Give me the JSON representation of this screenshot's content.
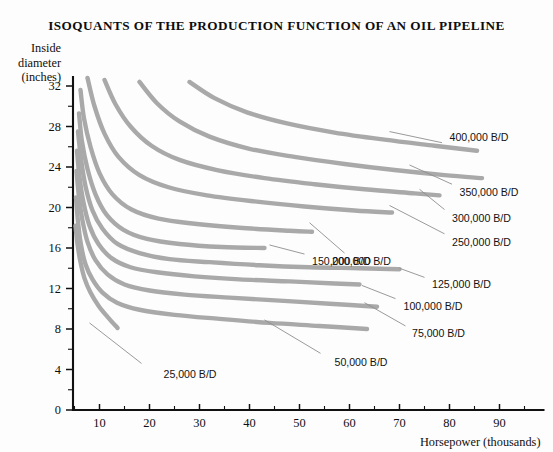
{
  "chart_data": {
    "type": "line",
    "title": "ISOQUANTS OF THE PRODUCTION FUNCTION OF AN OIL PIPELINE",
    "xlabel": "Horsepower (thousands)",
    "ylabel_lines": [
      "Inside",
      "diameter",
      "(inches)"
    ],
    "xlim": [
      4.7,
      99
    ],
    "ylim": [
      0,
      33
    ],
    "xticks": [
      10,
      20,
      30,
      40,
      50,
      60,
      70,
      80,
      90
    ],
    "xticks_minor": [
      5,
      15,
      25,
      35,
      45,
      55,
      65,
      75,
      85,
      95
    ],
    "yticks": [
      0,
      4,
      8,
      12,
      16,
      20,
      24,
      28,
      32
    ],
    "yticks_minor": [
      2,
      6,
      10,
      14,
      18,
      22,
      26,
      30
    ],
    "grid": false,
    "legend_position": "inline-labels-right",
    "curve_color": "#a9a9a9",
    "axis_color": "#111111",
    "series": [
      {
        "name": "25,000 B/D",
        "label": "25,000 B/D",
        "label_x": 22.8,
        "label_y": 3.6,
        "leader": [
          [
            18.4,
            4.6
          ],
          [
            8.0,
            8.6
          ]
        ],
        "points": [
          [
            5.2,
            18.2
          ],
          [
            5.6,
            16.4
          ],
          [
            6.2,
            14.6
          ],
          [
            7.0,
            13.0
          ],
          [
            8.2,
            11.6
          ],
          [
            9.8,
            10.3
          ],
          [
            11.6,
            9.2
          ],
          [
            13.6,
            8.1
          ]
        ]
      },
      {
        "name": "50,000 B/D",
        "label": "50,000 B/D",
        "label_x": 57.0,
        "label_y": 4.7,
        "leader": [
          [
            54.2,
            5.6
          ],
          [
            43.0,
            8.9
          ]
        ],
        "points": [
          [
            5.3,
            21.0
          ],
          [
            5.7,
            18.6
          ],
          [
            6.3,
            16.3
          ],
          [
            7.2,
            14.4
          ],
          [
            8.6,
            12.9
          ],
          [
            10.6,
            11.6
          ],
          [
            13.5,
            10.6
          ],
          [
            18.0,
            9.9
          ],
          [
            25.0,
            9.4
          ],
          [
            34.0,
            9.0
          ],
          [
            44.0,
            8.6
          ],
          [
            54.0,
            8.3
          ],
          [
            63.5,
            8.0
          ]
        ]
      },
      {
        "name": "75,000 B/D",
        "label": "75,000 B/D",
        "label_x": 72.5,
        "label_y": 7.6,
        "leader": [
          [
            71.2,
            8.3
          ],
          [
            63.0,
            10.6
          ]
        ],
        "points": [
          [
            5.4,
            23.6
          ],
          [
            5.9,
            21.0
          ],
          [
            6.6,
            18.7
          ],
          [
            7.6,
            16.6
          ],
          [
            9.2,
            14.8
          ],
          [
            11.6,
            13.4
          ],
          [
            15.0,
            12.4
          ],
          [
            20.0,
            11.8
          ],
          [
            27.0,
            11.4
          ],
          [
            36.0,
            11.1
          ],
          [
            46.0,
            10.8
          ],
          [
            56.0,
            10.5
          ],
          [
            65.5,
            10.2
          ]
        ]
      },
      {
        "name": "100,000 B/D",
        "label": "100,000 B/D",
        "label_x": 70.8,
        "label_y": 10.3,
        "leader": [
          [
            69.2,
            11.0
          ],
          [
            62.5,
            12.3
          ]
        ],
        "points": [
          [
            5.5,
            25.6
          ],
          [
            6.0,
            23.0
          ],
          [
            6.8,
            20.5
          ],
          [
            8.0,
            18.2
          ],
          [
            9.8,
            16.4
          ],
          [
            12.4,
            15.0
          ],
          [
            16.2,
            14.1
          ],
          [
            21.5,
            13.6
          ],
          [
            29.0,
            13.2
          ],
          [
            38.0,
            12.9
          ],
          [
            48.0,
            12.7
          ],
          [
            57.0,
            12.5
          ],
          [
            62.0,
            12.4
          ]
        ]
      },
      {
        "name": "125,000 B/D",
        "label": "125,000 B/D",
        "label_x": 76.5,
        "label_y": 12.4,
        "leader": [
          [
            75.0,
            13.1
          ],
          [
            70.0,
            14.0
          ]
        ],
        "points": [
          [
            5.7,
            27.5
          ],
          [
            6.3,
            24.8
          ],
          [
            7.2,
            22.1
          ],
          [
            8.6,
            19.7
          ],
          [
            10.6,
            17.9
          ],
          [
            13.6,
            16.4
          ],
          [
            18.0,
            15.5
          ],
          [
            24.0,
            14.9
          ],
          [
            32.0,
            14.6
          ],
          [
            42.0,
            14.3
          ],
          [
            52.0,
            14.1
          ],
          [
            62.0,
            14.0
          ],
          [
            70.0,
            13.9
          ]
        ]
      },
      {
        "name": "150,000 B/D",
        "label": "150,000 B/D",
        "label_x": 52.5,
        "label_y": 14.7,
        "leader": [
          [
            51.0,
            15.4
          ],
          [
            44.0,
            16.3
          ]
        ],
        "points": [
          [
            5.9,
            29.3
          ],
          [
            6.5,
            26.5
          ],
          [
            7.6,
            23.8
          ],
          [
            9.2,
            21.3
          ],
          [
            11.4,
            19.3
          ],
          [
            14.8,
            17.8
          ],
          [
            19.5,
            16.9
          ],
          [
            26.0,
            16.4
          ],
          [
            34.5,
            16.1
          ],
          [
            43.0,
            16.0
          ]
        ]
      },
      {
        "name": "200,000 B/D",
        "label": "200,000 B/D",
        "label_x": 56.5,
        "label_y": 14.7,
        "leader": [
          [
            59.0,
            15.5
          ],
          [
            52.0,
            18.5
          ]
        ],
        "points": [
          [
            6.2,
            31.6
          ],
          [
            6.9,
            28.8
          ],
          [
            8.2,
            26.0
          ],
          [
            10.0,
            23.4
          ],
          [
            12.6,
            21.3
          ],
          [
            16.4,
            19.8
          ],
          [
            21.8,
            18.9
          ],
          [
            29.0,
            18.4
          ],
          [
            38.0,
            18.0
          ],
          [
            48.0,
            17.7
          ],
          [
            52.5,
            17.6
          ]
        ]
      },
      {
        "name": "250,000 B/D",
        "label": "250,000 B/D",
        "label_x": 80.5,
        "label_y": 16.6,
        "leader": [
          [
            79.0,
            17.4
          ],
          [
            68.0,
            20.2
          ]
        ],
        "points": [
          [
            7.6,
            32.8
          ],
          [
            9.0,
            30.0
          ],
          [
            11.0,
            27.3
          ],
          [
            13.8,
            25.0
          ],
          [
            18.0,
            23.2
          ],
          [
            23.8,
            22.0
          ],
          [
            31.5,
            21.2
          ],
          [
            41.0,
            20.6
          ],
          [
            51.0,
            20.1
          ],
          [
            61.0,
            19.7
          ],
          [
            68.5,
            19.5
          ]
        ]
      },
      {
        "name": "300,000 B/D",
        "label": "300,000 B/D",
        "label_x": 80.5,
        "label_y": 19.0,
        "leader": [
          [
            79.0,
            19.8
          ],
          [
            74.0,
            21.8
          ]
        ],
        "points": [
          [
            11.0,
            32.6
          ],
          [
            13.2,
            30.2
          ],
          [
            16.2,
            28.0
          ],
          [
            20.4,
            26.1
          ],
          [
            26.0,
            24.7
          ],
          [
            33.5,
            23.7
          ],
          [
            43.0,
            22.9
          ],
          [
            53.0,
            22.3
          ],
          [
            63.0,
            21.8
          ],
          [
            73.0,
            21.4
          ],
          [
            78.0,
            21.2
          ]
        ]
      },
      {
        "name": "350,000 B/D",
        "label": "350,000 B/D",
        "label_x": 82.0,
        "label_y": 21.5,
        "leader": [
          [
            80.5,
            22.3
          ],
          [
            72.0,
            24.2
          ]
        ],
        "points": [
          [
            18.0,
            32.4
          ],
          [
            21.5,
            30.3
          ],
          [
            26.0,
            28.5
          ],
          [
            32.0,
            27.0
          ],
          [
            40.0,
            25.8
          ],
          [
            49.0,
            25.0
          ],
          [
            59.0,
            24.3
          ],
          [
            69.0,
            23.7
          ],
          [
            79.0,
            23.2
          ],
          [
            86.5,
            22.9
          ]
        ]
      },
      {
        "name": "400,000 B/D",
        "label": "400,000 B/D",
        "label_x": 80.0,
        "label_y": 27.0,
        "leader": [
          [
            78.5,
            26.4
          ],
          [
            68.0,
            27.5
          ]
        ],
        "points": [
          [
            28.0,
            32.4
          ],
          [
            33.0,
            30.8
          ],
          [
            39.5,
            29.4
          ],
          [
            47.5,
            28.3
          ],
          [
            57.0,
            27.4
          ],
          [
            67.0,
            26.7
          ],
          [
            77.0,
            26.1
          ],
          [
            85.5,
            25.6
          ]
        ]
      }
    ]
  }
}
